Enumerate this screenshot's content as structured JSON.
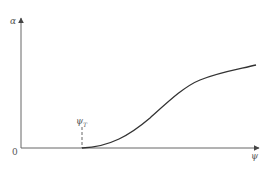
{
  "diagram": {
    "y_axis_label": "α",
    "x_axis_label": "ψ",
    "origin_label": "0",
    "threshold_label": "ψ",
    "threshold_subscript": "T"
  },
  "colors": {
    "axis": "#555555",
    "curve": "#333333",
    "dashed": "#555555"
  }
}
